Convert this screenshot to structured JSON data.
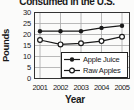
{
  "chart_data": {
    "type": "line",
    "title": "Consumed in the U.S.",
    "xlabel": "Year",
    "ylabel": "Pounds",
    "x": [
      "2001",
      "2002",
      "2003",
      "2004",
      "2005"
    ],
    "series": [
      {
        "name": "Apple Juice",
        "marker": "filled-circle",
        "values": [
          21.5,
          21.5,
          21.5,
          23,
          24
        ]
      },
      {
        "name": "Raw Apples",
        "marker": "open-circle",
        "values": [
          17.5,
          15.5,
          16,
          17,
          19
        ]
      }
    ],
    "ylim": [
      0,
      30
    ],
    "yticks": [
      0,
      5,
      10,
      15,
      20,
      25,
      30
    ],
    "grid": true,
    "legend_position": "bottom-right"
  },
  "colors": {
    "line": "#1a1a1a",
    "grid": "#a8a8a8",
    "axis": "#333333",
    "text": "#1a1a1a",
    "background": "#fbfbfa",
    "legend_background": "#ffffff"
  }
}
